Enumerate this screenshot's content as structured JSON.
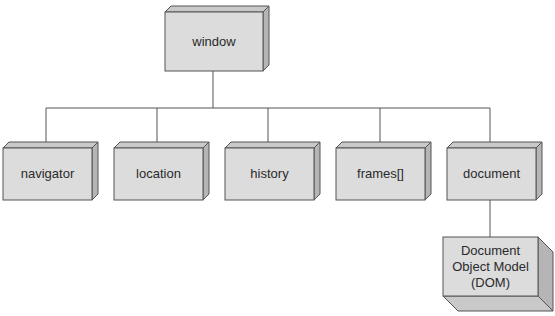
{
  "diagram": {
    "root": {
      "id": "window",
      "label": "window"
    },
    "children": [
      {
        "id": "navigator",
        "label": "navigator"
      },
      {
        "id": "location",
        "label": "location"
      },
      {
        "id": "history",
        "label": "history"
      },
      {
        "id": "frames",
        "label": "frames[]"
      },
      {
        "id": "document",
        "label": "document"
      }
    ],
    "grandchild": {
      "id": "dom",
      "parent": "document",
      "label_lines": [
        "Document",
        "Object Model",
        "(DOM)"
      ]
    }
  },
  "colors": {
    "front": "#dcdcdc",
    "top": "#c9c9c9",
    "side": "#b5b5b5",
    "stroke": "#555555",
    "line": "#555555"
  }
}
